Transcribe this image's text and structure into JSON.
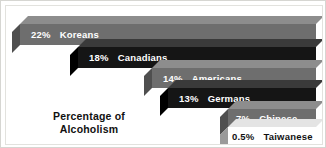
{
  "chart_data": {
    "type": "bar",
    "title": "Percentage of Alcoholism",
    "xlabel": "",
    "ylabel": "",
    "categories": [
      "Koreans",
      "Canadians",
      "Americans",
      "Germans",
      "Chinese",
      "Taiwanese"
    ],
    "values": [
      22,
      18,
      14,
      13,
      7,
      0.5
    ],
    "value_labels": [
      "22%",
      "18%",
      "14%",
      "13%",
      "7%",
      "0.5%"
    ],
    "grid": false,
    "legend": null,
    "orientation": "horizontal-3d-cascade",
    "note": "Bars are drawn as 3-D blocks of equal right edge; left edge steps rightward as the value decreases."
  },
  "caption": {
    "line1": "Percentage of",
    "line2": "Alcoholism"
  },
  "colors": {
    "bar_gray": "#6e6e6e",
    "bar_gray_top": "#8d8d8d",
    "bar_gray_side": "#4f4f4f",
    "bar_black": "#151515",
    "bar_black_top": "#3a3a3a",
    "bar_black_side": "#000000",
    "bar_white": "#ffffff",
    "bar_white_top": "#e4e4e4",
    "bar_white_side": "#9a9a9a",
    "text_on_dark": "#ffffff",
    "text_on_light": "#111111",
    "background": "#ffffff",
    "frame": "#d6d6d2"
  },
  "bars": [
    {
      "pct": "22%",
      "name": "Koreans",
      "style": "gray",
      "left": 14,
      "top": 18,
      "width": 296,
      "height": 21,
      "text_color": "#ffffff",
      "pct_indent": 11
    },
    {
      "pct": "18%",
      "name": "Canadians",
      "style": "black",
      "left": 72,
      "top": 41,
      "width": 238,
      "height": 21,
      "text_color": "#ffffff",
      "pct_indent": 11
    },
    {
      "pct": "14%",
      "name": "Americans",
      "style": "gray",
      "left": 146,
      "top": 62,
      "width": 164,
      "height": 20,
      "text_color": "#ffffff",
      "pct_indent": 11
    },
    {
      "pct": "13%",
      "name": "Germans",
      "style": "black",
      "left": 162,
      "top": 82,
      "width": 148,
      "height": 20,
      "text_color": "#ffffff",
      "pct_indent": 11
    },
    {
      "pct": "7%",
      "name": "Chinese",
      "style": "gray",
      "left": 222,
      "top": 103,
      "width": 88,
      "height": 18,
      "text_color": "#ffffff",
      "pct_indent": 8
    },
    {
      "pct": "0.5%",
      "name": "Taiwanese",
      "style": "white",
      "left": 222,
      "top": 121,
      "width": 88,
      "height": 18,
      "text_color": "#111111",
      "pct_indent": 4
    }
  ],
  "caption_box": {
    "left": 18,
    "top": 104,
    "width": 130
  }
}
